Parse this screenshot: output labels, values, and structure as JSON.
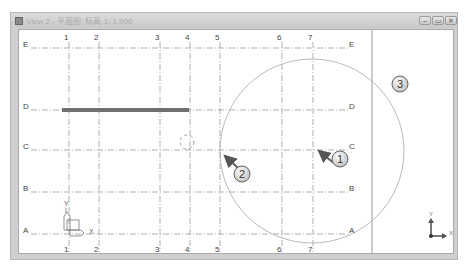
{
  "window": {
    "title": "View 2 - 平面图: 标高 1: 1,000",
    "buttons": {
      "minimize": "–",
      "restore": "▭",
      "close": "✕"
    }
  },
  "grid": {
    "columns": [
      {
        "label": "1",
        "x": 50
      },
      {
        "label": "2",
        "x": 80
      },
      {
        "label": "3",
        "x": 141
      },
      {
        "label": "4",
        "x": 171
      },
      {
        "label": "5",
        "x": 201
      },
      {
        "label": "6",
        "x": 263
      },
      {
        "label": "7",
        "x": 294
      }
    ],
    "rows": [
      {
        "label": "E",
        "y": 18
      },
      {
        "label": "D",
        "y": 80
      },
      {
        "label": "C",
        "y": 120
      },
      {
        "label": "B",
        "y": 162
      },
      {
        "label": "A",
        "y": 204
      }
    ],
    "line_color": "#8c8c8c"
  },
  "callouts": [
    {
      "label": "1",
      "x": 321,
      "y": 129
    },
    {
      "label": "2",
      "x": 223,
      "y": 144
    },
    {
      "label": "3",
      "x": 381,
      "y": 54
    }
  ],
  "axes": {
    "model_ucs": {
      "x_label": "X",
      "y_label": "Y"
    },
    "view_ucs": {
      "x_label": "X",
      "y_label": "Y"
    }
  },
  "colors": {
    "beam": "#707070",
    "circle": "#a8a8a8",
    "callout_fill": "#e6e6e6",
    "arrow": "#666666"
  }
}
